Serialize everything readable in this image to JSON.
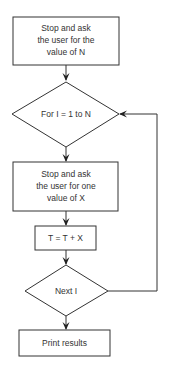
{
  "flowchart": {
    "nodes": [
      {
        "id": "ask-n",
        "type": "process",
        "lines": [
          "Stop and ask",
          "the user for the",
          "value of N"
        ]
      },
      {
        "id": "for-loop",
        "type": "decision",
        "lines": [
          "For I = 1 to N"
        ]
      },
      {
        "id": "ask-x",
        "type": "process",
        "lines": [
          "Stop and ask",
          "the user for one",
          "value of X"
        ]
      },
      {
        "id": "accumulate",
        "type": "process",
        "lines": [
          "T = T + X"
        ]
      },
      {
        "id": "next-i",
        "type": "decision",
        "lines": [
          "Next I"
        ]
      },
      {
        "id": "print",
        "type": "process",
        "lines": [
          "Print results"
        ]
      }
    ],
    "edges": [
      {
        "from": "ask-n",
        "to": "for-loop"
      },
      {
        "from": "for-loop",
        "to": "ask-x"
      },
      {
        "from": "ask-x",
        "to": "accumulate"
      },
      {
        "from": "accumulate",
        "to": "next-i"
      },
      {
        "from": "next-i",
        "to": "for-loop",
        "label": "loop back"
      },
      {
        "from": "next-i",
        "to": "print"
      }
    ]
  },
  "colors": {
    "stroke": "#333333",
    "background": "#ffffff"
  }
}
